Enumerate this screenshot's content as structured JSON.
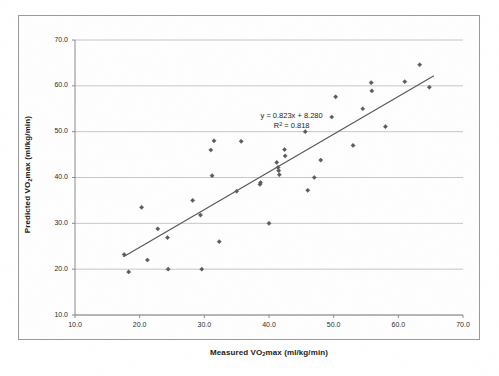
{
  "chart_data": {
    "type": "scatter",
    "title": "",
    "xlabel": "Measured VO2max (ml/kg/min)",
    "ylabel": "Predicted VO2max (ml/kg/min)",
    "xlabel_parts": {
      "pre": "Measured VO",
      "sub": "2",
      "post": "max (ml/kg/min)"
    },
    "ylabel_parts": {
      "pre": "Predicted VO",
      "sub": "2",
      "post": "max (ml/kg/min)"
    },
    "xlim": [
      10.0,
      70.0
    ],
    "ylim": [
      10.0,
      70.0
    ],
    "xticks": [
      "10.0",
      "20.0",
      "30.0",
      "40.0",
      "50.0",
      "60.0",
      "70.0"
    ],
    "yticks": [
      "10.0",
      "20.0",
      "30.0",
      "40.0",
      "50.0",
      "60.0",
      "70.0"
    ],
    "xtick_values": [
      10,
      20,
      30,
      40,
      50,
      60,
      70
    ],
    "ytick_values": [
      10,
      20,
      30,
      40,
      50,
      60,
      70
    ],
    "grid": "horizontal",
    "legend": "none",
    "marker": "diamond",
    "marker_color": "#5a5a5a",
    "line_color": "#555555",
    "gridline_color": "#b8b8b8",
    "axis_color": "#808080",
    "annotations": [
      {
        "text": "y = 0.823x + 8.280",
        "x": 43.5,
        "y": 53.4
      },
      {
        "text": "R² = 0.818",
        "x": 43.5,
        "y": 51.2
      }
    ],
    "equation": {
      "slope": 0.823,
      "intercept": 8.28,
      "r_squared": 0.818,
      "line_label": "y = 0.823x + 8.280",
      "r2_label": "R² = 0.818"
    },
    "trendline": {
      "x_start": 17.5,
      "y_start": 22.7,
      "x_end": 65.5,
      "y_end": 62.2
    },
    "series": [
      {
        "name": "Subjects",
        "points": [
          [
            17.6,
            23.2
          ],
          [
            18.3,
            19.4
          ],
          [
            20.3,
            33.5
          ],
          [
            21.2,
            22.0
          ],
          [
            22.8,
            28.8
          ],
          [
            24.3,
            26.9
          ],
          [
            24.4,
            20.0
          ],
          [
            28.2,
            35.0
          ],
          [
            29.4,
            31.8
          ],
          [
            29.6,
            20.0
          ],
          [
            31.0,
            46.0
          ],
          [
            31.2,
            40.4
          ],
          [
            31.5,
            48.0
          ],
          [
            32.3,
            26.0
          ],
          [
            35.0,
            37.0
          ],
          [
            35.7,
            47.9
          ],
          [
            38.6,
            38.5
          ],
          [
            38.7,
            38.9
          ],
          [
            40.0,
            30.0
          ],
          [
            41.2,
            43.3
          ],
          [
            41.4,
            42.2
          ],
          [
            41.5,
            41.5
          ],
          [
            41.6,
            40.6
          ],
          [
            42.4,
            46.1
          ],
          [
            42.5,
            44.7
          ],
          [
            45.6,
            50.0
          ],
          [
            46.0,
            37.2
          ],
          [
            47.0,
            40.0
          ],
          [
            48.0,
            43.8
          ],
          [
            49.7,
            53.2
          ],
          [
            50.3,
            57.6
          ],
          [
            53.0,
            47.0
          ],
          [
            54.5,
            55.0
          ],
          [
            55.8,
            60.7
          ],
          [
            55.9,
            58.9
          ],
          [
            58.0,
            51.1
          ],
          [
            61.0,
            60.9
          ],
          [
            63.3,
            64.6
          ],
          [
            64.8,
            59.7
          ]
        ]
      }
    ]
  }
}
